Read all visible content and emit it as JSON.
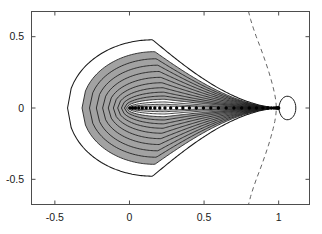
{
  "figure": {
    "background_color": "#ffffff",
    "axes_color": "#4d4d4d",
    "curve_color": "#1a1a1a",
    "shade_color": "#9d9d9d",
    "dash_color": "#666666",
    "dot_color": "#000000",
    "width": 322,
    "height": 234
  },
  "axes": {
    "frame": {
      "left": 31,
      "top": 11,
      "right": 310,
      "bottom": 205
    },
    "xlim": [
      -0.66,
      1.21
    ],
    "ylim": [
      -0.68,
      0.68
    ],
    "x_ticks": [
      -0.5,
      0,
      0.5,
      1
    ],
    "y_ticks": [
      -0.5,
      0,
      0.5
    ],
    "x_tick_labels": [
      "-0.5",
      "0",
      "0.5",
      "1"
    ],
    "y_tick_labels": [
      "-0.5",
      "0",
      "0.5"
    ],
    "grid": false,
    "title": "",
    "xlabel": "",
    "ylabel": ""
  },
  "chart_data": {
    "type": "line",
    "title": "",
    "xlabel": "",
    "ylabel": "",
    "xlim": [
      -0.66,
      1.21
    ],
    "ylim": [
      -0.68,
      0.68
    ],
    "grid": false,
    "legend": "none",
    "series": [
      {
        "name": "contour-levels",
        "type": "closed-teardrop-family",
        "note": "Each level k traces a closed loop through the cusp point (1, 0); a = left extent, h = half-height, xh = x of max height.",
        "levels": [
          {
            "k": 1,
            "a": -0.415,
            "h": 0.478,
            "xh": 0.155,
            "shaded": false
          },
          {
            "k": 2,
            "a": -0.318,
            "h": 0.395,
            "xh": 0.17,
            "shaded": true
          },
          {
            "k": 3,
            "a": -0.268,
            "h": 0.345,
            "xh": 0.18,
            "shaded": true
          },
          {
            "k": 4,
            "a": -0.222,
            "h": 0.3,
            "xh": 0.19,
            "shaded": true
          },
          {
            "k": 5,
            "a": -0.18,
            "h": 0.256,
            "xh": 0.2,
            "shaded": true
          },
          {
            "k": 6,
            "a": -0.142,
            "h": 0.215,
            "xh": 0.21,
            "shaded": true
          },
          {
            "k": 7,
            "a": -0.108,
            "h": 0.177,
            "xh": 0.218,
            "shaded": true
          },
          {
            "k": 8,
            "a": -0.079,
            "h": 0.142,
            "xh": 0.225,
            "shaded": true
          },
          {
            "k": 9,
            "a": -0.054,
            "h": 0.111,
            "xh": 0.23,
            "shaded": true
          },
          {
            "k": 10,
            "a": -0.034,
            "h": 0.084,
            "xh": 0.235,
            "shaded": true
          },
          {
            "k": 11,
            "a": -0.019,
            "h": 0.061,
            "xh": 0.238,
            "shaded": true
          },
          {
            "k": 12,
            "a": -0.008,
            "h": 0.042,
            "xh": 0.24,
            "shaded": false
          },
          {
            "k": 13,
            "a": -0.002,
            "h": 0.026,
            "xh": 0.242,
            "shaded": false
          },
          {
            "k": 14,
            "a": 0.002,
            "h": 0.014,
            "xh": 0.244,
            "shaded": false
          }
        ],
        "shaded_band": {
          "outer_level": 2,
          "inner_level": 11,
          "color": "#9d9d9d"
        }
      },
      {
        "name": "outer-lobe",
        "type": "closed-loop",
        "note": "Small bulb right of the cusp at x=1",
        "x_left": 1.0,
        "x_right": 1.115,
        "half_height": 0.125
      },
      {
        "name": "marker-trail",
        "type": "scatter",
        "marker": "filled-circle",
        "y": 0.0,
        "x": [
          0.003,
          0.02,
          0.04,
          0.062,
          0.086,
          0.112,
          0.14,
          0.17,
          0.203,
          0.238,
          0.276,
          0.316,
          0.358,
          0.402,
          0.448,
          0.496,
          0.545,
          0.596,
          0.648,
          0.7,
          0.752,
          0.803,
          0.851,
          0.894,
          0.928,
          0.952,
          0.968,
          0.98,
          0.988,
          0.993,
          0.997,
          1.0
        ]
      },
      {
        "name": "dashed-separatrix",
        "type": "dashed-curve",
        "style": "dashed",
        "note": "Symmetric about y = 0; vertex near x = 0.985 at y = 0, sweeping left to x ≈ 0.80 at |y| ≈ 0.68",
        "points": [
          {
            "x": 0.797,
            "y": 0.68
          },
          {
            "x": 0.812,
            "y": 0.62
          },
          {
            "x": 0.83,
            "y": 0.56
          },
          {
            "x": 0.85,
            "y": 0.5
          },
          {
            "x": 0.872,
            "y": 0.44
          },
          {
            "x": 0.893,
            "y": 0.38
          },
          {
            "x": 0.913,
            "y": 0.32
          },
          {
            "x": 0.932,
            "y": 0.26
          },
          {
            "x": 0.949,
            "y": 0.2
          },
          {
            "x": 0.963,
            "y": 0.145
          },
          {
            "x": 0.974,
            "y": 0.095
          },
          {
            "x": 0.981,
            "y": 0.05
          },
          {
            "x": 0.985,
            "y": 0.0
          },
          {
            "x": 0.981,
            "y": -0.05
          },
          {
            "x": 0.974,
            "y": -0.095
          },
          {
            "x": 0.963,
            "y": -0.145
          },
          {
            "x": 0.949,
            "y": -0.2
          },
          {
            "x": 0.932,
            "y": -0.26
          },
          {
            "x": 0.913,
            "y": -0.32
          },
          {
            "x": 0.893,
            "y": -0.38
          },
          {
            "x": 0.872,
            "y": -0.44
          },
          {
            "x": 0.85,
            "y": -0.5
          },
          {
            "x": 0.83,
            "y": -0.56
          },
          {
            "x": 0.812,
            "y": -0.62
          },
          {
            "x": 0.797,
            "y": -0.68
          }
        ]
      }
    ]
  }
}
